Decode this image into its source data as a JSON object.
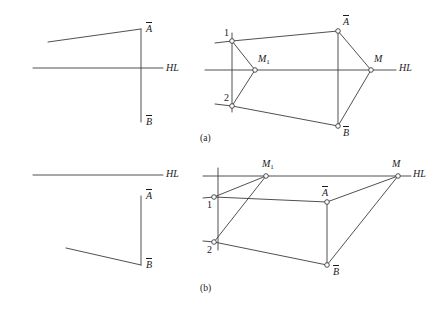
{
  "figure": {
    "background": "#ffffff",
    "stroke_color": "#3c3c3c",
    "text_color": "#1a1a1a",
    "node_fill": "#ffffff",
    "width": 436,
    "height": 311
  },
  "captions": {
    "a": "(a)",
    "b": "(b)"
  },
  "labels": {
    "horizon": "HL",
    "point_a": "A",
    "point_b": "B",
    "point_m": "M",
    "point_m1_base": "M",
    "point_m1_sub": "1",
    "point_1": "1",
    "point_2": "2"
  },
  "panels": [
    {
      "id": "a-left",
      "name": "orthographic-view-a",
      "horizon_line": {
        "x1": 33,
        "y1": 68,
        "x2": 163,
        "y2": 68
      },
      "vertical_line": {
        "x1": 141,
        "y1": 29,
        "x2": 141,
        "y2": 122
      },
      "oblique_line": {
        "x1": 48,
        "y1": 42,
        "x2": 141,
        "y2": 29
      },
      "label_a": {
        "x": 146,
        "y": 22
      },
      "label_b": {
        "x": 146,
        "y": 115
      },
      "label_hl": {
        "x": 166,
        "y": 63
      }
    },
    {
      "id": "a-right",
      "name": "perspective-view-a",
      "horizon_line": {
        "x1": 205,
        "y1": 70,
        "x2": 396,
        "y2": 70
      },
      "label_hl": {
        "x": 399,
        "y": 63
      },
      "vertical_line_left": {
        "x1": 232,
        "y1": 33,
        "x2": 232,
        "y2": 112
      },
      "vertical_line_right": {
        "x1": 338,
        "y1": 31,
        "x2": 338,
        "y2": 126
      },
      "nodes": [
        {
          "name": "node-1",
          "x": 232,
          "y": 41,
          "label": "1",
          "lx": 224,
          "ly": 28,
          "italic": false,
          "overline": false
        },
        {
          "name": "node-2",
          "x": 232,
          "y": 106,
          "label": "2",
          "lx": 224,
          "ly": 93,
          "italic": false,
          "overline": false
        },
        {
          "name": "node-m1",
          "x": 255,
          "y": 70,
          "label": "M1",
          "lx": 258,
          "ly": 54,
          "italic": true,
          "overline": false
        },
        {
          "name": "node-a",
          "x": 338,
          "y": 31,
          "label": "A",
          "lx": 343,
          "ly": 15,
          "italic": true,
          "overline": true
        },
        {
          "name": "node-b",
          "x": 338,
          "y": 126,
          "label": "B",
          "lx": 343,
          "ly": 126,
          "italic": true,
          "overline": true
        },
        {
          "name": "node-m",
          "x": 371,
          "y": 70,
          "label": "M",
          "lx": 374,
          "ly": 54,
          "italic": true,
          "overline": false
        }
      ],
      "edges": [
        {
          "name": "edge-1-a",
          "x1": 232,
          "y1": 41,
          "x2": 338,
          "y2": 31
        },
        {
          "name": "edge-2-b",
          "x1": 232,
          "y1": 106,
          "x2": 338,
          "y2": 126
        },
        {
          "name": "edge-a-m",
          "x1": 338,
          "y1": 31,
          "x2": 371,
          "y2": 70
        },
        {
          "name": "edge-b-m",
          "x1": 338,
          "y1": 126,
          "x2": 371,
          "y2": 70
        },
        {
          "name": "edge-1-m1",
          "x1": 232,
          "y1": 41,
          "x2": 255,
          "y2": 70
        },
        {
          "name": "edge-2-m1",
          "x1": 232,
          "y1": 106,
          "x2": 255,
          "y2": 70
        }
      ],
      "stub_lines": [
        {
          "name": "stub-left-1",
          "x1": 215,
          "y1": 43,
          "x2": 232,
          "y2": 41
        },
        {
          "name": "stub-left-2",
          "x1": 215,
          "y1": 104,
          "x2": 232,
          "y2": 106
        }
      ]
    },
    {
      "id": "b-left",
      "name": "orthographic-view-b",
      "horizon_line": {
        "x1": 33,
        "y1": 175,
        "x2": 163,
        "y2": 175
      },
      "vertical_line": {
        "x1": 141,
        "y1": 196,
        "x2": 141,
        "y2": 265
      },
      "oblique_line": {
        "x1": 66,
        "y1": 248,
        "x2": 141,
        "y2": 265
      },
      "label_a": {
        "x": 146,
        "y": 189
      },
      "label_b": {
        "x": 146,
        "y": 258
      },
      "label_hl": {
        "x": 166,
        "y": 169
      }
    },
    {
      "id": "b-right",
      "name": "perspective-view-b",
      "horizon_line": {
        "x1": 203,
        "y1": 176,
        "x2": 411,
        "y2": 176
      },
      "label_hl": {
        "x": 413,
        "y": 169
      },
      "vertical_line_left": {
        "x1": 218,
        "y1": 168,
        "x2": 218,
        "y2": 250
      },
      "vertical_line_right": {
        "x1": 327,
        "y1": 202,
        "x2": 327,
        "y2": 265
      },
      "nodes": [
        {
          "name": "node-1",
          "x": 214,
          "y": 197,
          "label": "1",
          "lx": 207,
          "ly": 200,
          "italic": false,
          "overline": false
        },
        {
          "name": "node-2",
          "x": 214,
          "y": 242,
          "label": "2",
          "lx": 207,
          "ly": 245,
          "italic": false,
          "overline": false
        },
        {
          "name": "node-m1",
          "x": 266,
          "y": 176,
          "label": "M1",
          "lx": 262,
          "ly": 159,
          "italic": true,
          "overline": false
        },
        {
          "name": "node-a",
          "x": 327,
          "y": 202,
          "label": "A",
          "lx": 322,
          "ly": 186,
          "italic": true,
          "overline": true
        },
        {
          "name": "node-b",
          "x": 327,
          "y": 265,
          "label": "B",
          "lx": 333,
          "ly": 265,
          "italic": true,
          "overline": true
        },
        {
          "name": "node-m",
          "x": 398,
          "y": 176,
          "label": "M",
          "lx": 392,
          "ly": 159,
          "italic": true,
          "overline": false
        }
      ],
      "edges": [
        {
          "name": "edge-1-a",
          "x1": 214,
          "y1": 197,
          "x2": 327,
          "y2": 202
        },
        {
          "name": "edge-a-m",
          "x1": 327,
          "y1": 202,
          "x2": 398,
          "y2": 176
        },
        {
          "name": "edge-2-b",
          "x1": 214,
          "y1": 242,
          "x2": 327,
          "y2": 265
        },
        {
          "name": "edge-b-m",
          "x1": 327,
          "y1": 265,
          "x2": 398,
          "y2": 176
        },
        {
          "name": "edge-1-m1",
          "x1": 214,
          "y1": 197,
          "x2": 266,
          "y2": 176
        },
        {
          "name": "edge-2-m1",
          "x1": 214,
          "y1": 242,
          "x2": 266,
          "y2": 176
        }
      ],
      "stub_lines": [
        {
          "name": "stub-left-1",
          "x1": 203,
          "y1": 198,
          "x2": 214,
          "y2": 197
        },
        {
          "name": "stub-left-2",
          "x1": 203,
          "y1": 241,
          "x2": 214,
          "y2": 242
        }
      ]
    }
  ]
}
